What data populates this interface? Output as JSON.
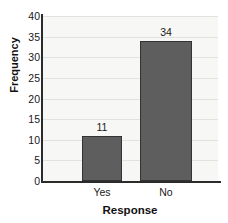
{
  "chart_data": {
    "type": "bar",
    "title": "",
    "subtitle": "",
    "xlabel": "Response",
    "ylabel": "Frequency",
    "categories": [
      "Yes",
      "No"
    ],
    "values": [
      11,
      34
    ],
    "data_labels": [
      "11",
      "34"
    ],
    "ylim": [
      0,
      40
    ],
    "ytick_labels": [
      "40",
      "35",
      "30",
      "25",
      "20",
      "15",
      "10",
      "5",
      "0"
    ],
    "ytick_values": [
      40,
      35,
      30,
      25,
      20,
      15,
      10,
      5,
      0
    ],
    "xtick_labels": [
      "Yes",
      "No"
    ],
    "grid": "horizontal",
    "legend": "none",
    "colors": {
      "bar_fill": "#5e5e5e",
      "bar_edge": "#333333",
      "plot_background": "#f7f7f5",
      "gridline": "#e2e2de",
      "axis_spine": "#2b2b2b",
      "text": "#1a1a1a",
      "page_background": "#ffffff"
    }
  }
}
